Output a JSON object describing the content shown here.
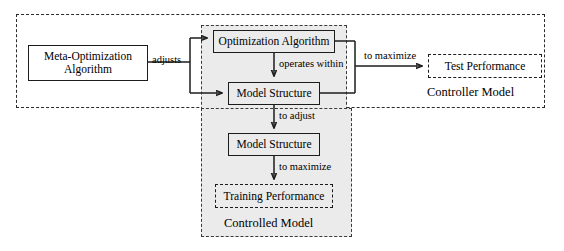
{
  "diagram": {
    "type": "block-flow-diagram",
    "colors": {
      "shaded_region_fill": "#ebebeb",
      "box_stroke": "#1c1c1c",
      "dashed_stroke": "#2b2b2b",
      "background": "#ffffff"
    },
    "nodes": {
      "meta_optimization": {
        "line1": "Meta-Optimization",
        "line2": "Algorithm"
      },
      "optimization_algorithm": {
        "label": "Optimization Algorithm"
      },
      "model_structure_upper": {
        "label": "Model Structure"
      },
      "model_structure_lower": {
        "label": "Model Structure"
      },
      "test_performance": {
        "label": "Test Performance"
      },
      "training_performance": {
        "label": "Training Performance"
      }
    },
    "region_captions": {
      "controller_model": "Controller Model",
      "controlled_model": "Controlled Model"
    },
    "edge_labels": {
      "adjusts": "adjusts",
      "operates_within": "operates within",
      "to_maximize_test": "to maximize",
      "to_adjust": "to adjust",
      "to_maximize_training": "to maximize"
    }
  }
}
